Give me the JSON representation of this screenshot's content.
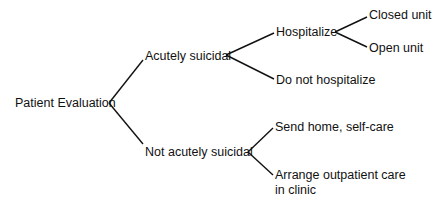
{
  "diagram": {
    "type": "decision-tree",
    "root": {
      "label": "Patient Evaluation",
      "children": [
        {
          "label": "Acutely suicidal",
          "children": [
            {
              "label": "Hospitalize",
              "children": [
                {
                  "label": "Closed unit"
                },
                {
                  "label": "Open unit"
                }
              ]
            },
            {
              "label": "Do not hospitalize"
            }
          ]
        },
        {
          "label": "Not acutely suicidal",
          "children": [
            {
              "label": "Send home, self-care"
            },
            {
              "label": "Arrange outpatient care",
              "label_line2": "in clinic"
            }
          ]
        }
      ]
    },
    "colors": {
      "line": "#111111",
      "text": "#111111",
      "background": "#ffffff"
    }
  }
}
